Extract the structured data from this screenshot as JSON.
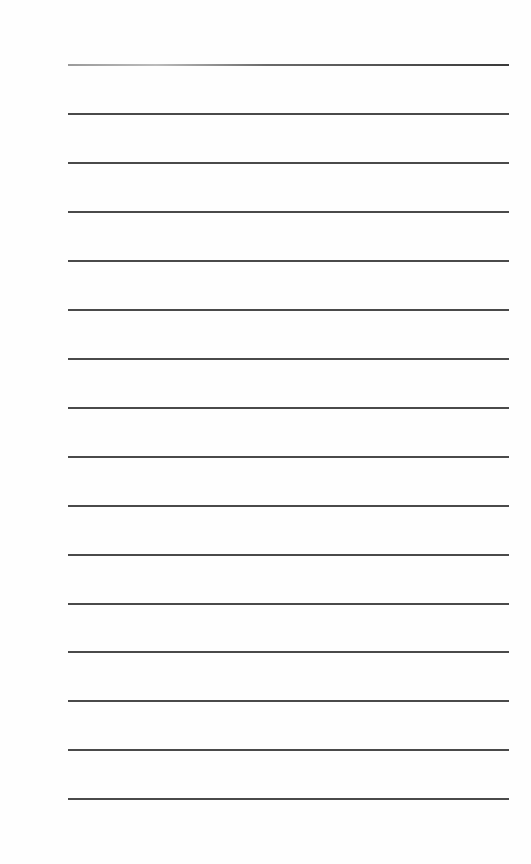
{
  "page": {
    "type": "lined-paper",
    "background_color": "#fefefe",
    "line_color": "#4a4a4a",
    "line_count": 16,
    "line_left_px": 68,
    "line_right_px": 509,
    "line_y_positions": [
      64,
      113,
      162,
      211,
      260,
      309,
      358,
      407,
      456,
      505,
      554,
      603,
      651,
      700,
      749,
      798
    ]
  }
}
